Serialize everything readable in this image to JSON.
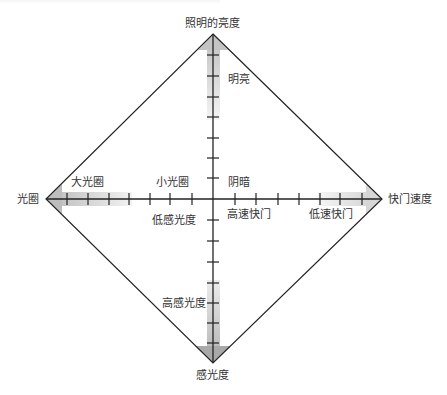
{
  "diagram": {
    "title_top": "照明的亮度",
    "axis_left": "光圈",
    "axis_right": "快门速度",
    "axis_bottom": "感光度",
    "labels": {
      "bright": "明亮",
      "dark": "阴暗",
      "large_aperture": "大光圈",
      "small_aperture": "小光圈",
      "fast_shutter": "高速快门",
      "slow_shutter": "低速快门",
      "low_iso": "低感光度",
      "high_iso": "高感光度"
    },
    "colors": {
      "line": "#222222",
      "arrow_fill": "#b8b8b8",
      "gradient_dark": "#c8c8c8",
      "gradient_light": "#f2f2f2",
      "text": "#333333"
    }
  }
}
